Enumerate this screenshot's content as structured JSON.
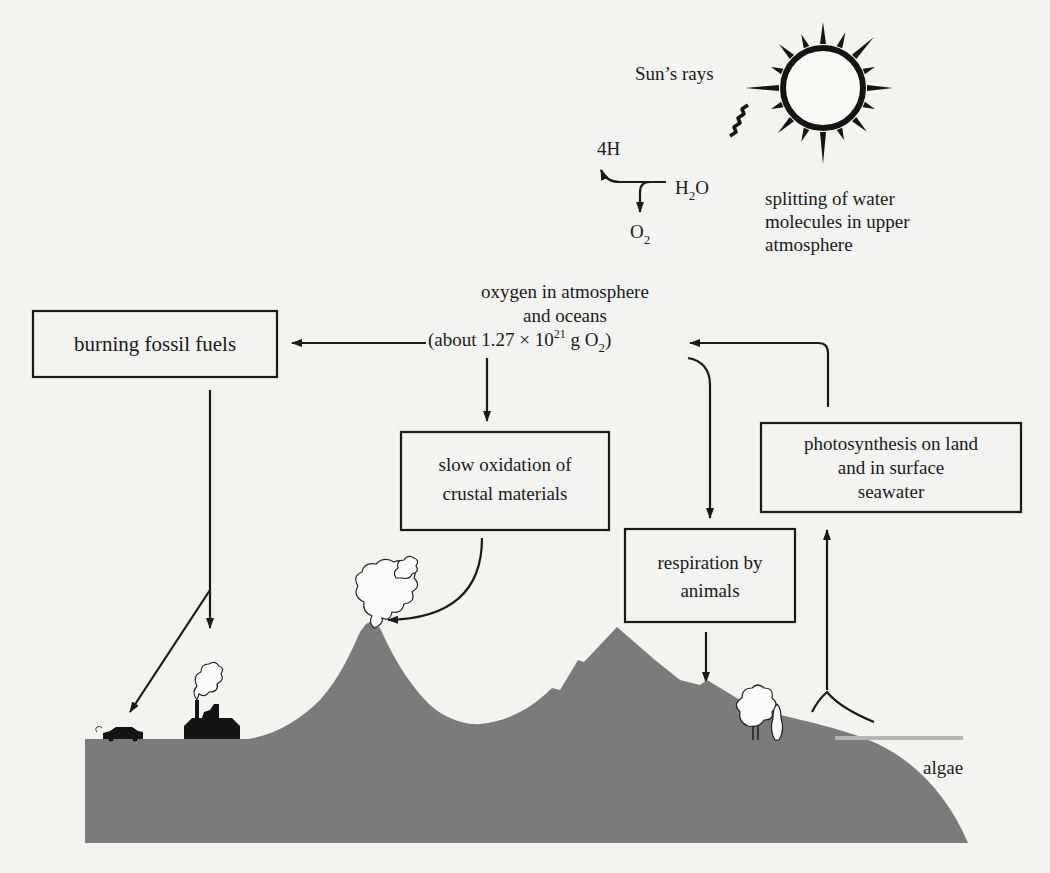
{
  "diagram": {
    "sun": {
      "label": "Sun’s rays",
      "icon": "sun-icon"
    },
    "water_splitting": {
      "reactant": "H",
      "reactant_sub": "2",
      "reactant_tail": "O",
      "product_h": "4H",
      "product_o": "O",
      "product_o_sub": "2",
      "caption": [
        "splitting of water",
        "molecules in upper",
        "atmosphere"
      ]
    },
    "reservoir": {
      "lines": [
        "oxygen in atmosphere",
        "and oceans"
      ],
      "amount_prefix": "(about 1.27 × 10",
      "amount_exp": "21",
      "amount_mid": " g O",
      "amount_sub": "2",
      "amount_suffix": ")"
    },
    "boxes": {
      "burning": [
        "burning fossil fuels"
      ],
      "oxidation": [
        "slow oxidation of",
        "crustal materials"
      ],
      "respiration": [
        "respiration by",
        "animals"
      ],
      "photosynthesis": [
        "photosynthesis on land",
        "and in surface",
        "seawater"
      ]
    },
    "landscape": {
      "algae_label": "algae",
      "icons": [
        "car-icon",
        "factory-icon",
        "volcano-icon",
        "mountain-icon",
        "tree-icon",
        "algae-icon"
      ]
    },
    "colors": {
      "land": "#7b7b7b",
      "ink": "#1a1a1a",
      "background": "#f3f3f1",
      "water": "#b5b5b5"
    }
  }
}
